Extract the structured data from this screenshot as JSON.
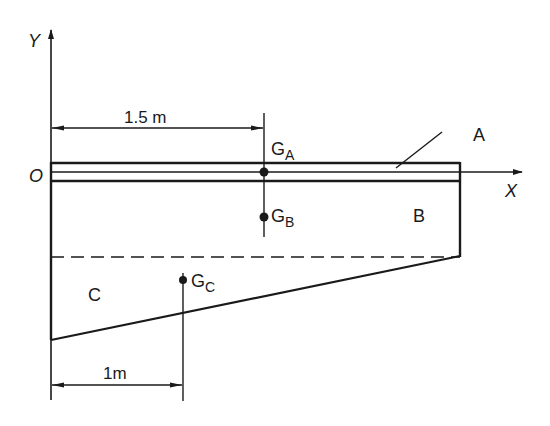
{
  "diagram": {
    "axes": {
      "x_label": "X",
      "y_label": "Y",
      "origin_label": "O"
    },
    "regions": {
      "a": "A",
      "b": "B",
      "c": "C"
    },
    "centroids": {
      "ga": {
        "main": "G",
        "sub": "A"
      },
      "gb": {
        "main": "G",
        "sub": "B"
      },
      "gc": {
        "main": "G",
        "sub": "C"
      }
    },
    "dimensions": {
      "ga_distance": "1.5 m",
      "gc_distance": "1m"
    },
    "colors": {
      "ink": "#1a1a1a",
      "background": "#ffffff"
    }
  }
}
